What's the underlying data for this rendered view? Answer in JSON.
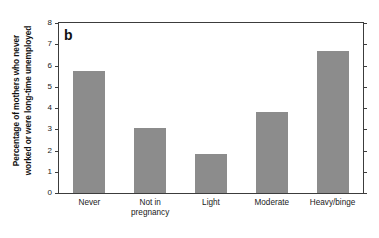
{
  "figure": {
    "panel_letter": "b",
    "background_color": "#ffffff",
    "bar_color": "#8c8c8c",
    "axis_color": "#3c3c3c"
  },
  "chart_data": {
    "type": "bar",
    "title": "",
    "subtitle": "",
    "panel_label": "b",
    "categories": [
      "Never",
      "Not in pregnancy",
      "Light",
      "Moderate",
      "Heavy/binge"
    ],
    "category_lines": [
      [
        "Never"
      ],
      [
        "Not in",
        "pregnancy"
      ],
      [
        "Light"
      ],
      [
        "Moderate"
      ],
      [
        "Heavy/binge"
      ]
    ],
    "values": [
      5.75,
      3.05,
      1.82,
      3.82,
      6.7
    ],
    "xlabel": "",
    "ylabel": "Percentage of mothers who never worked or were long-time unemployed",
    "ylabel_lines": [
      "Percentage of mothers who never",
      "worked or were long-time unemployed"
    ],
    "ylim": [
      0,
      8
    ],
    "ytick_values": [
      0,
      1,
      2,
      3,
      4,
      5,
      6,
      7,
      8
    ],
    "ytick_labels": [
      "0",
      "1",
      "2",
      "3",
      "4",
      "5",
      "6",
      "7",
      "8"
    ],
    "grid": false,
    "legend": null,
    "legend_position": "none",
    "series_color": "#8c8c8c",
    "frame": "box",
    "ticks_mirrored": true
  }
}
